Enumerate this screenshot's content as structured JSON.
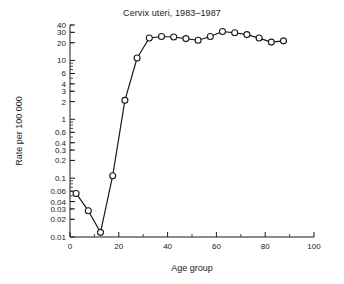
{
  "chart_data": {
    "type": "line",
    "title": "Cervix uteri, 1983–1987",
    "xlabel": "Age group",
    "ylabel": "Rate per 100 000",
    "yscale": "log",
    "xlim": [
      0,
      100
    ],
    "ylim": [
      0.01,
      40
    ],
    "grid": false,
    "legend": null,
    "marker": "open-circle",
    "x": [
      2.5,
      7.5,
      12.5,
      17.5,
      22.5,
      27.5,
      32.5,
      37.5,
      42.5,
      47.5,
      52.5,
      57.5,
      62.5,
      67.5,
      72.5,
      77.5,
      82.5,
      87.5
    ],
    "values": [
      0.055,
      0.028,
      0.012,
      0.11,
      2.1,
      11.0,
      24.0,
      25.5,
      25.0,
      23.5,
      22.0,
      25.5,
      31.0,
      29.5,
      27.5,
      24.0,
      20.5,
      21.5
    ],
    "series": [
      {
        "name": "Cervix uteri",
        "x": [
          2.5,
          7.5,
          12.5,
          17.5,
          22.5,
          27.5,
          32.5,
          37.5,
          42.5,
          47.5,
          52.5,
          57.5,
          62.5,
          67.5,
          72.5,
          77.5,
          82.5,
          87.5
        ],
        "values": [
          0.055,
          0.028,
          0.012,
          0.11,
          2.1,
          11.0,
          24.0,
          25.5,
          25.0,
          23.5,
          22.0,
          25.5,
          31.0,
          29.5,
          27.5,
          24.0,
          20.5,
          21.5
        ]
      }
    ],
    "ytick_labels": [
      "40",
      "30",
      "20",
      "10",
      "6",
      "4",
      "3",
      "2",
      "1",
      "0.6",
      "0.4",
      "0.3",
      "0.2",
      "0.1",
      "0.06",
      "0.04",
      "0.03",
      "0.02",
      "0.01"
    ],
    "ytick_values": [
      40,
      30,
      20,
      10,
      6,
      4,
      3,
      2,
      1,
      0.6,
      0.4,
      0.3,
      0.2,
      0.1,
      0.06,
      0.04,
      0.03,
      0.02,
      0.01
    ],
    "xtick_labels": [
      "0",
      "20",
      "40",
      "60",
      "80",
      "100"
    ],
    "xtick_values": [
      0,
      20,
      40,
      60,
      80,
      100
    ],
    "line_color": "#1a1a1a",
    "marker_face_color": "#ffffff",
    "background_color": "#ffffff"
  }
}
